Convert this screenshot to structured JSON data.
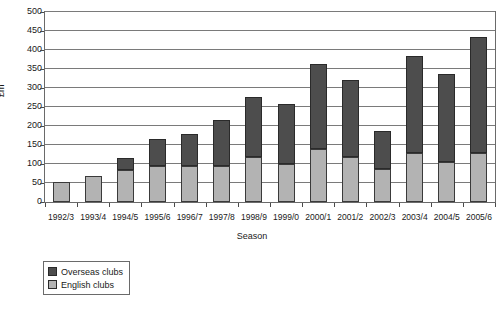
{
  "chart_data": {
    "type": "bar",
    "stacked": true,
    "title": "",
    "xlabel": "Season",
    "ylabel": "£m",
    "ylim": [
      0,
      500
    ],
    "ytick_step": 50,
    "grid": true,
    "legend_position": "bottom-left",
    "categories": [
      "1992/3",
      "1993/4",
      "1994/5",
      "1995/6",
      "1996/7",
      "1997/8",
      "1998/9",
      "1999/0",
      "2000/1",
      "2001/2",
      "2002/3",
      "2003/4",
      "2004/5",
      "2005/6"
    ],
    "yticks": [
      0,
      50,
      100,
      150,
      200,
      250,
      300,
      350,
      400,
      450,
      500
    ],
    "series": [
      {
        "name": "English clubs",
        "color": "#b3b3b3",
        "values": [
          52,
          68,
          85,
          95,
          95,
          95,
          118,
          100,
          140,
          118,
          88,
          130,
          105,
          128
        ]
      },
      {
        "name": "Overseas clubs",
        "color": "#4d4d4d",
        "values": [
          0,
          0,
          30,
          70,
          85,
          120,
          158,
          158,
          222,
          202,
          100,
          255,
          232,
          305
        ]
      }
    ],
    "totals": [
      52,
      68,
      115,
      165,
      180,
      215,
      276,
      258,
      362,
      320,
      188,
      385,
      337,
      433
    ]
  },
  "legend": {
    "items": [
      {
        "label": "Overseas clubs",
        "key": "overseas"
      },
      {
        "label": "English clubs",
        "key": "english"
      }
    ]
  }
}
